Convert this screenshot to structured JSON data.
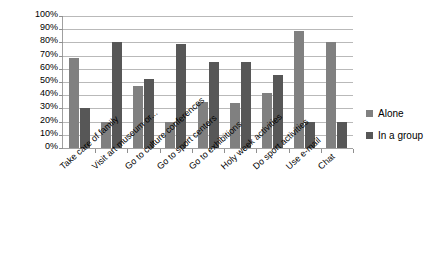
{
  "chart_data": {
    "type": "bar",
    "title": "",
    "subtitle": "",
    "xlabel": "",
    "ylabel": "",
    "ylim": [
      0,
      100
    ],
    "grid": true,
    "legend_position": "right",
    "y_ticks": [
      "100%",
      "90%",
      "80%",
      "70%",
      "60%",
      "50%",
      "40%",
      "30%",
      "20%",
      "10%",
      "0%"
    ],
    "y_tick_values": [
      100,
      90,
      80,
      70,
      60,
      50,
      40,
      30,
      20,
      10,
      0
    ],
    "categories": [
      "Take care of family",
      "Visit art museum or...",
      "Go to culture conferences",
      "Go to sport centers",
      "Go to exhibitions",
      "Holy week activities",
      "Do sport activities",
      "Use e-mail",
      "Chat"
    ],
    "series": [
      {
        "name": "Alone",
        "color": "#808080",
        "values": [
          68,
          20,
          47,
          20,
          35,
          34,
          42,
          89,
          80
        ]
      },
      {
        "name": "In a group",
        "color": "#575757",
        "values": [
          30,
          80,
          52,
          79,
          65,
          65,
          55,
          20,
          20
        ]
      }
    ]
  },
  "legend": {
    "items": [
      {
        "label": "Alone",
        "color": "#808080"
      },
      {
        "label": "In a group",
        "color": "#575757"
      }
    ]
  }
}
